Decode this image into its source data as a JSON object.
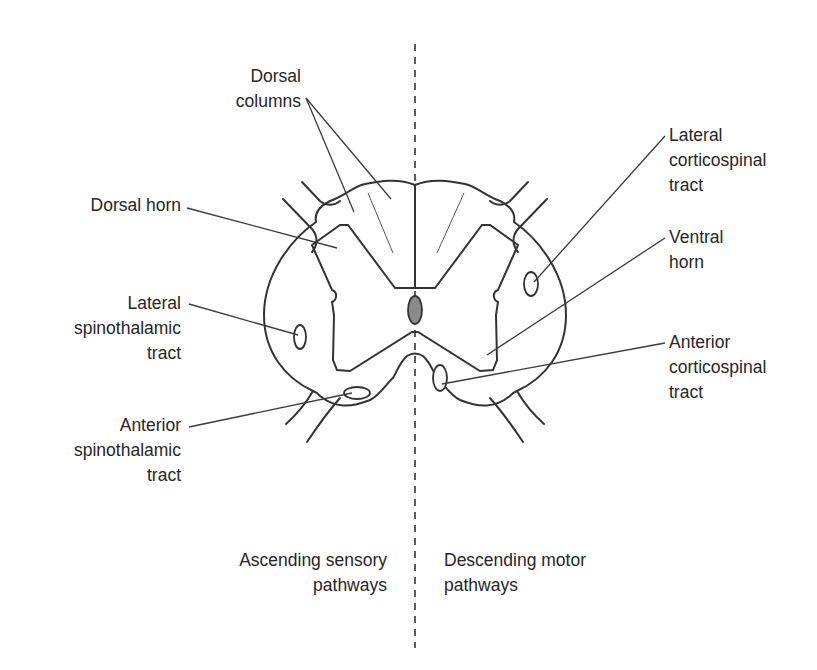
{
  "diagram": {
    "colors": {
      "line": "#333333",
      "text": "#262626",
      "canal_fill": "#8a8a8a",
      "background": "#ffffff"
    },
    "labels": {
      "dorsal_columns": {
        "line1": "Dorsal",
        "line2": "columns"
      },
      "dorsal_horn": {
        "line1": "Dorsal horn"
      },
      "lateral_spinothalamic": {
        "line1": "Lateral",
        "line2": "spinothalamic",
        "line3": "tract"
      },
      "anterior_spinothalamic": {
        "line1": "Anterior",
        "line2": "spinothalamic",
        "line3": "tract"
      },
      "lateral_corticospinal": {
        "line1": "Lateral",
        "line2": "corticospinal",
        "line3": "tract"
      },
      "ventral_horn": {
        "line1": "Ventral",
        "line2": "horn"
      },
      "anterior_corticospinal": {
        "line1": "Anterior",
        "line2": "corticospinal",
        "line3": "tract"
      },
      "ascending": {
        "line1": "Ascending sensory",
        "line2": "pathways"
      },
      "descending": {
        "line1": "Descending motor",
        "line2": "pathways"
      }
    },
    "sides": {
      "left": "Ascending sensory pathways",
      "right": "Descending motor pathways"
    },
    "structures": [
      "spinal-cord-outline",
      "gray-matter",
      "central-canal",
      "dorsal-roots",
      "ventral-roots",
      "midline-divider"
    ]
  }
}
